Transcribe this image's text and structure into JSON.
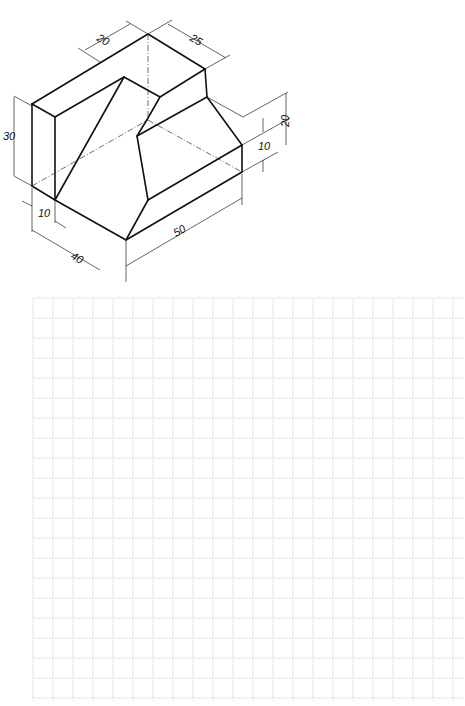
{
  "isometric_view": {
    "dimensions": {
      "top_left_depth": "20",
      "top_right_depth": "25",
      "left_height": "30",
      "right_height": "20",
      "right_step": "10",
      "bottom_left_offset": "10",
      "front_width": "40",
      "right_length": "50"
    }
  },
  "grid_sheet": {
    "origin_x": 33,
    "origin_y": 298,
    "cell_size": 20,
    "columns": 22,
    "rows": 20,
    "line_color": "#c4c4c4"
  },
  "colors": {
    "line": "#111111",
    "background": "#ffffff"
  }
}
